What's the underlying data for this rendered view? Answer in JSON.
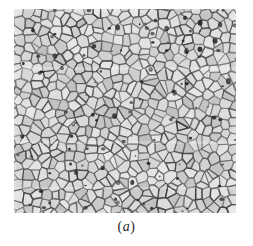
{
  "figure": {
    "caption_open_paren": "(",
    "caption_letter": "a",
    "caption_close_paren": ")",
    "caption_full": "(a)",
    "kind": "optical-micrograph",
    "page_background": "#ffffff"
  },
  "micrograph": {
    "alt_text": "Grayscale optical micrograph of a polycrystalline metal showing equiaxed grains outlined by dark etched grain boundaries, with scattered dark precipitates and pits",
    "matrix_color": "#d9d9d7",
    "grain_fill_light": "#e3e3e1",
    "grain_fill_dark": "#c9c9c7",
    "boundary_color": "#3a3a3a",
    "precipitate_color": "#151515",
    "frame": {
      "left": 14,
      "top": 9,
      "width": 222,
      "height": 204
    },
    "texture": {
      "grain_count": 560,
      "mean_grain_diameter_px": 9,
      "boundary_line_width_px": 0.8,
      "precipitate_count": 120,
      "scan_bands": [
        {
          "top": 58,
          "height": 3,
          "tone": "light"
        },
        {
          "top": 132,
          "height": 3,
          "tone": "light"
        },
        {
          "top": 178,
          "height": 2,
          "tone": "light"
        }
      ]
    }
  }
}
